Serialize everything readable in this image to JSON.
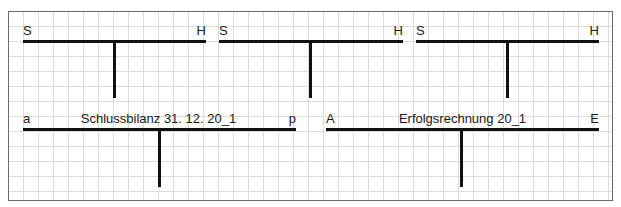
{
  "t_accounts_row1": [
    {
      "left_label": "S",
      "right_label": "H",
      "title": ""
    },
    {
      "left_label": "S",
      "right_label": "H",
      "title": ""
    },
    {
      "left_label": "S",
      "right_label": "H",
      "title": ""
    }
  ],
  "schlussbilanz": {
    "left_label": "a",
    "title": "Schlussbilanz 31. 12. 20_1",
    "right_label": "p"
  },
  "erfolgsrechnung": {
    "left_label": "A",
    "title": "Erfolgsrechnung 20_1",
    "right_label": "E"
  }
}
